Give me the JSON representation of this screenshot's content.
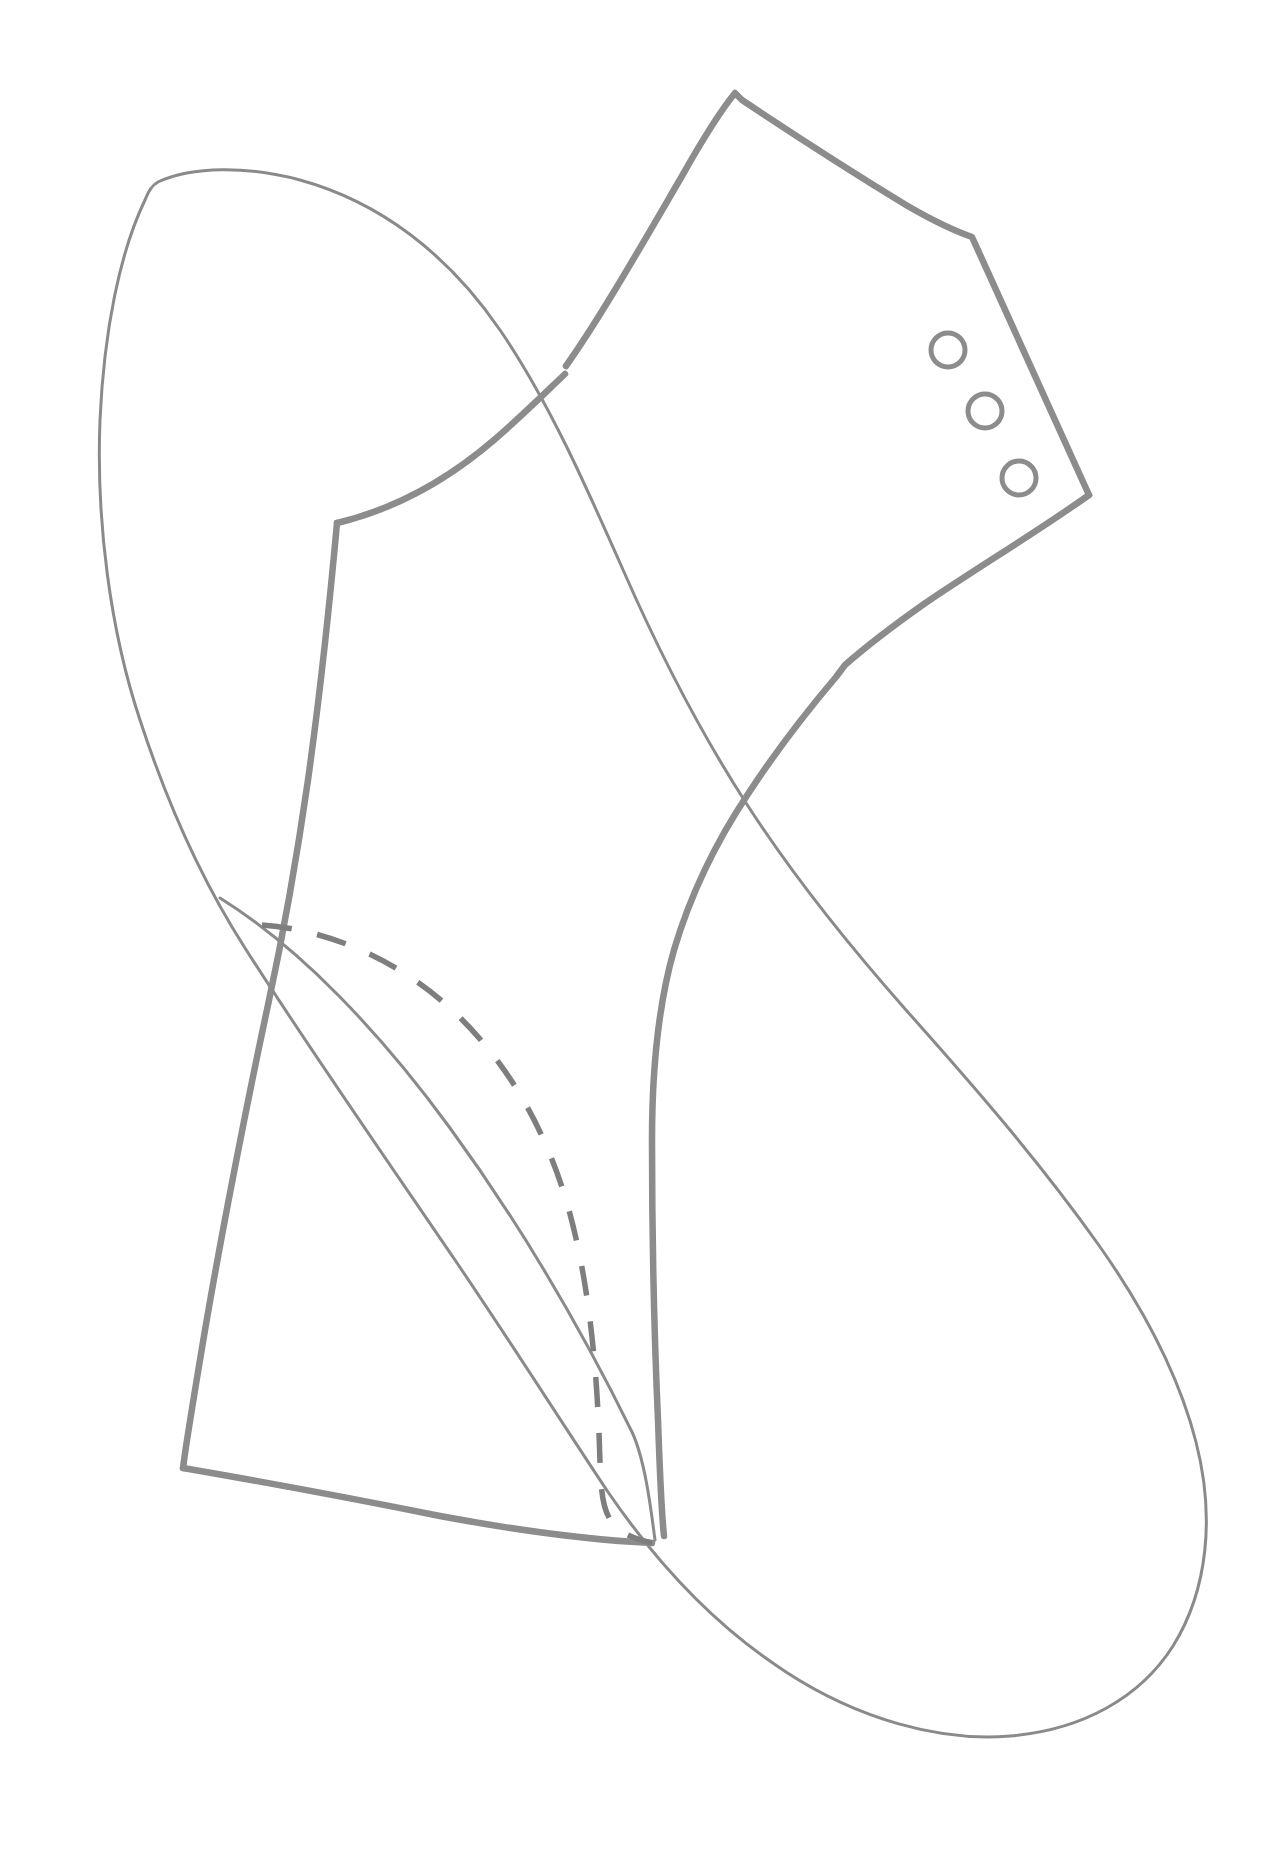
{
  "document": {
    "kind": "hand-drawn-sewing-pattern",
    "title": "",
    "background_color": "#ffffff",
    "canvas": {
      "width": 1269,
      "height": 1857
    }
  },
  "ink": {
    "thin_stroke_color": "#8a8a8a",
    "thick_stroke_color": "#8c8c8c",
    "dashed_stroke_color": "#7e7e7e",
    "thin_stroke_width": 3,
    "thick_stroke_width": 6.5,
    "dashed_stroke_width": 5.5,
    "dash_pattern": "30 26"
  },
  "shapes": {
    "thin_outline": {
      "name": "thin-pattern-outline",
      "closed": true,
      "path": "M 145 200 C 120 252 104 330 100 420 C 96 520 110 630 140 720 C 170 812 204 884 245 948 C 300 1035 380 1150 455 1260 C 512 1344 560 1420 608 1492 C 660 1568 718 1628 786 1672 C 858 1719 940 1742 1010 1736 C 1082 1730 1140 1698 1173 1646 C 1208 1590 1215 1516 1196 1442 C 1178 1372 1142 1306 1098 1244 C 1040 1162 972 1084 906 1010 C 846 942 792 874 748 806 C 700 732 660 654 624 572 C 586 486 548 400 500 330 C 448 254 380 202 300 180 C 248 166 192 166 158 182 C 152 185 148 192 145 200 Z"
    },
    "thick_outline_upper": {
      "name": "thick-pattern-upper-segment",
      "closed": false,
      "path": "M 566 366 C 600 318 640 248 682 176 C 700 144 718 114 735 93 L 742 100 C 790 132 852 172 906 205 C 930 219 952 230 972 237 L 1089 495"
    },
    "thick_outline_bodice": {
      "name": "thick-pattern-shoulder-to-cross",
      "closed": false,
      "path": "M 337 523 C 400 508 452 476 494 440 C 524 414 548 390 565 374"
    },
    "thick_outline_left_side": {
      "name": "thick-pattern-left-side",
      "closed": false,
      "path": "M 337 523 C 330 600 320 694 308 780 C 296 864 282 940 268 1005 C 248 1098 218 1250 200 1360 C 192 1408 186 1444 183 1468"
    },
    "thick_outline_hem": {
      "name": "thick-pattern-hem",
      "closed": false,
      "path": "M 183 1468 C 270 1483 360 1500 440 1516 C 520 1531 592 1540 652 1543"
    },
    "thick_outline_right_curve": {
      "name": "thick-pattern-right-side-seam",
      "closed": false,
      "path": "M 1089 495 C 1040 530 980 566 924 604 C 890 628 862 650 845 665 L 836 677 C 808 710 778 748 748 794 C 714 845 690 896 674 950 C 658 1006 652 1070 652 1140 C 652 1230 654 1330 658 1420 C 660 1478 662 1518 664 1536"
    },
    "dashed_seam_line": {
      "name": "dashed-seam-line",
      "closed": false,
      "path": "M 262 925 C 330 930 398 960 452 1010 C 508 1062 548 1132 570 1214 C 592 1296 598 1390 600 1462 C 602 1512 604 1532 652 1543"
    },
    "thin_inner_diagonal": {
      "name": "thin-inner-diagonal-seam",
      "closed": false,
      "path": "M 220 898 C 300 948 380 1032 450 1128 C 520 1224 582 1330 632 1432 C 646 1462 652 1518 655 1540"
    },
    "buttonholes": [
      {
        "name": "buttonhole-top",
        "cx": 948,
        "cy": 350,
        "r": 17
      },
      {
        "name": "buttonhole-middle",
        "cx": 985,
        "cy": 411,
        "r": 17
      },
      {
        "name": "buttonhole-bottom",
        "cx": 1019,
        "cy": 478,
        "r": 17
      }
    ]
  }
}
